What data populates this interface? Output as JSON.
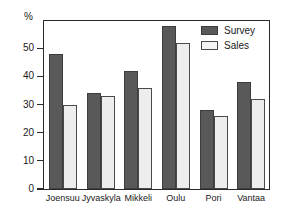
{
  "chart_data": {
    "type": "bar",
    "title": "",
    "subtitle": "",
    "xlabel": "",
    "ylabel": "%",
    "ylim": [
      0,
      60
    ],
    "yticks": [
      0,
      10,
      20,
      30,
      40,
      50
    ],
    "ytick_labels": [
      "0",
      "10",
      "20",
      "30",
      "40",
      "50"
    ],
    "grid": false,
    "legend_position": "top-right",
    "categories": [
      "Joensuu",
      "Jyvaskyla",
      "Mikkeli",
      "Oulu",
      "Pori",
      "Vantaa"
    ],
    "series": [
      {
        "name": "Survey",
        "color": "#595959",
        "values": [
          48,
          34,
          42,
          58,
          28,
          38
        ]
      },
      {
        "name": "Sales",
        "color": "#ededed",
        "values": [
          30,
          33,
          36,
          52,
          26,
          32
        ]
      }
    ],
    "annotations": []
  },
  "legend": {
    "items": [
      {
        "label": "Survey"
      },
      {
        "label": "Sales"
      }
    ]
  },
  "axis": {
    "unit_label": "%"
  }
}
